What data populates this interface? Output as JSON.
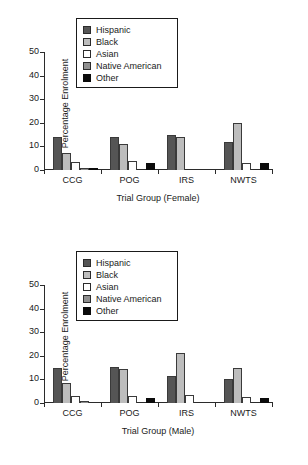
{
  "document": {
    "background_color": "#ffffff",
    "figure_count": 2
  },
  "series_colors": {
    "Hispanic": "#555555",
    "Black": "#bdbdbd",
    "Asian": "#ffffff",
    "Native American": "#8f8f8f",
    "Other": "#0b0b0b"
  },
  "legend": {
    "items": [
      {
        "label": "Hispanic",
        "swatch": "dark-gray-swatch"
      },
      {
        "label": "Black",
        "swatch": "light-gray-swatch"
      },
      {
        "label": "Asian",
        "swatch": "white-swatch"
      },
      {
        "label": "Native American",
        "swatch": "medium-gray-swatch"
      },
      {
        "label": "Other",
        "swatch": "black-swatch"
      }
    ]
  },
  "chart_data": [
    {
      "type": "bar",
      "id": "female",
      "title": "",
      "xlabel": "Trial Group (Female)",
      "ylabel": "Percentage Enrolment",
      "ylim": [
        0,
        50
      ],
      "yticks": [
        0,
        10,
        20,
        30,
        40,
        50
      ],
      "grid": false,
      "legend_position": "upper-left-inside",
      "categories": [
        "CCG",
        "POG",
        "IRS",
        "NWTS"
      ],
      "series": [
        {
          "name": "Hispanic",
          "values": [
            14,
            14,
            15,
            12
          ]
        },
        {
          "name": "Black",
          "values": [
            7,
            11,
            14,
            20
          ]
        },
        {
          "name": "Asian",
          "values": [
            3.5,
            4,
            0,
            3
          ]
        },
        {
          "name": "Native American",
          "values": [
            1,
            0,
            0,
            0
          ]
        },
        {
          "name": "Other",
          "values": [
            1,
            3,
            0,
            3
          ]
        }
      ]
    },
    {
      "type": "bar",
      "id": "male",
      "title": "",
      "xlabel": "Trial Group (Male)",
      "ylabel": "Percentage Enrolment",
      "ylim": [
        0,
        50
      ],
      "yticks": [
        0,
        10,
        20,
        30,
        40,
        50
      ],
      "grid": false,
      "legend_position": "upper-left-inside",
      "categories": [
        "CCG",
        "POG",
        "IRS",
        "NWTS"
      ],
      "series": [
        {
          "name": "Hispanic",
          "values": [
            15,
            15.2,
            11.4,
            10
          ]
        },
        {
          "name": "Black",
          "values": [
            8.5,
            14.4,
            21,
            15
          ]
        },
        {
          "name": "Asian",
          "values": [
            3,
            3,
            3.6,
            2.4
          ]
        },
        {
          "name": "Native American",
          "values": [
            0.7,
            0,
            0,
            0
          ]
        },
        {
          "name": "Other",
          "values": [
            0,
            2,
            0,
            2
          ]
        }
      ]
    }
  ],
  "figures": [
    {
      "name": "female",
      "xlabel": "Trial Group (Female)",
      "ylabel": "Percentage Enrolment",
      "yticks": [
        "0",
        "10",
        "20",
        "30",
        "40",
        "50"
      ],
      "categories": [
        "CCG",
        "POG",
        "IRS",
        "NWTS"
      ]
    },
    {
      "name": "male",
      "xlabel": "Trial Group (Male)",
      "ylabel": "Percentage Enrolment",
      "yticks": [
        "0",
        "10",
        "20",
        "30",
        "40",
        "50"
      ],
      "categories": [
        "CCG",
        "POG",
        "IRS",
        "NWTS"
      ]
    }
  ]
}
